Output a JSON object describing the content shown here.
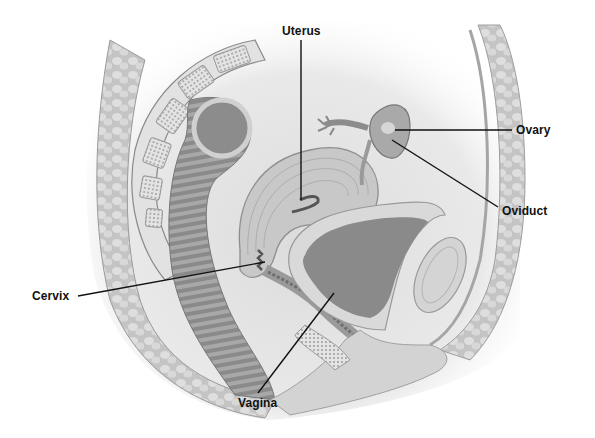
{
  "diagram": {
    "type": "anatomical-illustration",
    "style": "grayscale",
    "colors": {
      "background": "#ffffff",
      "tissue_light": "#e6e6e6",
      "tissue_mid": "#bdbdbd",
      "tissue_dark": "#7a7a7a",
      "leader_line": "#111111",
      "label_text": "#111111"
    }
  },
  "labels": {
    "uterus": "Uterus",
    "ovary": "Ovary",
    "oviduct": "Oviduct",
    "cervix": "Cervix",
    "vagina": "Vagina"
  }
}
